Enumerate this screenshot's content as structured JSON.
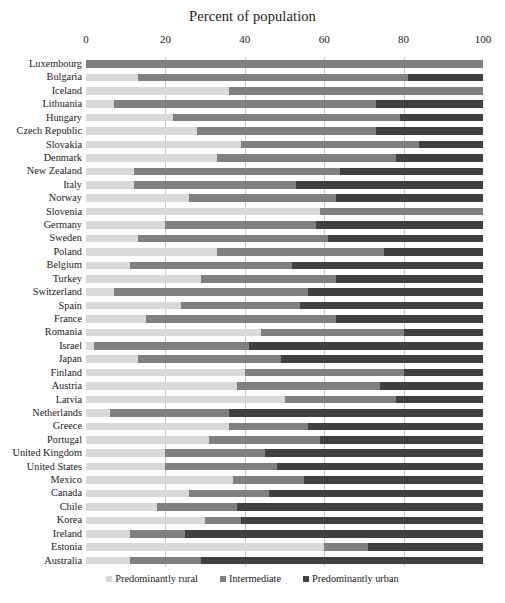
{
  "chart_data": {
    "type": "bar",
    "orientation": "horizontal",
    "stacked": true,
    "stack_total": 100,
    "title": "Percent of population",
    "xlabel": "",
    "ylabel": "",
    "xlim": [
      0,
      100
    ],
    "xticks": [
      0,
      20,
      40,
      60,
      80,
      100
    ],
    "grid": true,
    "legend_position": "bottom",
    "colors": {
      "rural": "#d9d9d9",
      "intermediate": "#808080",
      "urban": "#404040"
    },
    "series": [
      {
        "name": "Predominantly rural",
        "key": "rural"
      },
      {
        "name": "Intermediate",
        "key": "intermediate"
      },
      {
        "name": "Predominantly urban",
        "key": "urban"
      }
    ],
    "categories": [
      "Luxembourg",
      "Bulgaria",
      "Iceland",
      "Lithuania",
      "Hungary",
      "Czech Republic",
      "Slovakia",
      "Denmark",
      "New Zealand",
      "Italy",
      "Norway",
      "Slovenia",
      "Germany",
      "Sweden",
      "Poland",
      "Belgium",
      "Turkey",
      "Switzerland",
      "Spain",
      "France",
      "Romania",
      "Israel",
      "Japan",
      "Finland",
      "Austria",
      "Latvia",
      "Netherlands",
      "Greece",
      "Portugal",
      "United Kingdom",
      "United States",
      "Mexico",
      "Canada",
      "Chile",
      "Korea",
      "Ireland",
      "Estonia",
      "Australia"
    ],
    "rows": [
      {
        "category": "Luxembourg",
        "rural": 0,
        "intermediate": 100,
        "urban": 0
      },
      {
        "category": "Bulgaria",
        "rural": 13,
        "intermediate": 68,
        "urban": 19
      },
      {
        "category": "Iceland",
        "rural": 36,
        "intermediate": 64,
        "urban": 0
      },
      {
        "category": "Lithuania",
        "rural": 7,
        "intermediate": 66,
        "urban": 27
      },
      {
        "category": "Hungary",
        "rural": 22,
        "intermediate": 57,
        "urban": 21
      },
      {
        "category": "Czech Republic",
        "rural": 28,
        "intermediate": 45,
        "urban": 27
      },
      {
        "category": "Slovakia",
        "rural": 39,
        "intermediate": 45,
        "urban": 16
      },
      {
        "category": "Denmark",
        "rural": 33,
        "intermediate": 45,
        "urban": 22
      },
      {
        "category": "New Zealand",
        "rural": 12,
        "intermediate": 52,
        "urban": 36
      },
      {
        "category": "Italy",
        "rural": 12,
        "intermediate": 41,
        "urban": 47
      },
      {
        "category": "Norway",
        "rural": 26,
        "intermediate": 37,
        "urban": 37
      },
      {
        "category": "Slovenia",
        "rural": 59,
        "intermediate": 41,
        "urban": 0
      },
      {
        "category": "Germany",
        "rural": 20,
        "intermediate": 38,
        "urban": 42
      },
      {
        "category": "Sweden",
        "rural": 13,
        "intermediate": 48,
        "urban": 39
      },
      {
        "category": "Poland",
        "rural": 33,
        "intermediate": 42,
        "urban": 25
      },
      {
        "category": "Belgium",
        "rural": 11,
        "intermediate": 41,
        "urban": 48
      },
      {
        "category": "Turkey",
        "rural": 29,
        "intermediate": 34,
        "urban": 37
      },
      {
        "category": "Switzerland",
        "rural": 7,
        "intermediate": 49,
        "urban": 44
      },
      {
        "category": "Spain",
        "rural": 24,
        "intermediate": 30,
        "urban": 46
      },
      {
        "category": "France",
        "rural": 15,
        "intermediate": 48,
        "urban": 37
      },
      {
        "category": "Romania",
        "rural": 44,
        "intermediate": 36,
        "urban": 20
      },
      {
        "category": "Israel",
        "rural": 2,
        "intermediate": 39,
        "urban": 59
      },
      {
        "category": "Japan",
        "rural": 13,
        "intermediate": 36,
        "urban": 51
      },
      {
        "category": "Finland",
        "rural": 40,
        "intermediate": 40,
        "urban": 20
      },
      {
        "category": "Austria",
        "rural": 38,
        "intermediate": 36,
        "urban": 26
      },
      {
        "category": "Latvia",
        "rural": 50,
        "intermediate": 28,
        "urban": 22
      },
      {
        "category": "Netherlands",
        "rural": 6,
        "intermediate": 30,
        "urban": 64
      },
      {
        "category": "Greece",
        "rural": 36,
        "intermediate": 20,
        "urban": 44
      },
      {
        "category": "Portugal",
        "rural": 31,
        "intermediate": 28,
        "urban": 41
      },
      {
        "category": "United Kingdom",
        "rural": 20,
        "intermediate": 25,
        "urban": 55
      },
      {
        "category": "United States",
        "rural": 20,
        "intermediate": 28,
        "urban": 52
      },
      {
        "category": "Mexico",
        "rural": 37,
        "intermediate": 18,
        "urban": 45
      },
      {
        "category": "Canada",
        "rural": 26,
        "intermediate": 20,
        "urban": 54
      },
      {
        "category": "Chile",
        "rural": 18,
        "intermediate": 20,
        "urban": 62
      },
      {
        "category": "Korea",
        "rural": 30,
        "intermediate": 9,
        "urban": 61
      },
      {
        "category": "Ireland",
        "rural": 11,
        "intermediate": 14,
        "urban": 75
      },
      {
        "category": "Estonia",
        "rural": 60,
        "intermediate": 11,
        "urban": 29
      },
      {
        "category": "Australia",
        "rural": 11,
        "intermediate": 18,
        "urban": 71
      }
    ]
  },
  "legend": {
    "items": [
      {
        "label": "Predominantly rural",
        "color": "#d9d9d9"
      },
      {
        "label": "Intermediate",
        "color": "#808080"
      },
      {
        "label": "Predominantly urban",
        "color": "#404040"
      }
    ]
  }
}
